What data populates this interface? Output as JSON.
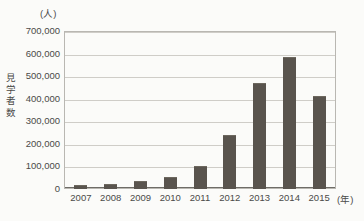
{
  "chart_data": {
    "type": "bar",
    "title": "",
    "subtitle": "",
    "xlabel": "(年)",
    "ylabel": "見学者数",
    "y_unit_caption": "(人)",
    "categories": [
      "2007",
      "2008",
      "2009",
      "2010",
      "2011",
      "2012",
      "2013",
      "2014",
      "2015"
    ],
    "values": [
      17000,
      21000,
      35000,
      53000,
      103000,
      240000,
      470000,
      583000,
      412000
    ],
    "series": [
      {
        "name": "見学者数",
        "values": [
          17000,
          21000,
          35000,
          53000,
          103000,
          240000,
          470000,
          583000,
          412000
        ]
      }
    ],
    "ylim": [
      0,
      700000
    ],
    "y_ticks": [
      0,
      100000,
      200000,
      300000,
      400000,
      500000,
      600000,
      700000
    ],
    "y_tick_labels": [
      "0",
      "100,000",
      "200,000",
      "300,000",
      "400,000",
      "500,000",
      "600,000",
      "700,000"
    ],
    "grid": true,
    "legend": "none",
    "bar_color": "#59544e",
    "grid_color": "#cfcdc8",
    "axis_color": "#6e6c67",
    "background_color": "#fbfbf9"
  },
  "axis_title_chars": [
    "見",
    "学",
    "者",
    "数"
  ]
}
